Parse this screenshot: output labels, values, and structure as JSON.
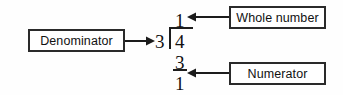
{
  "diagram": {
    "type": "long-division-callout",
    "colors": {
      "background": "#fefefe",
      "stroke": "#2a2a2a",
      "text": "#111111",
      "rule": "#1c1c1c"
    },
    "callouts": [
      {
        "id": "denominator",
        "label": "Denominator",
        "points_to": "divisor",
        "arrow_direction": "right"
      },
      {
        "id": "whole_number",
        "label": "Whole number",
        "points_to": "quotient",
        "arrow_direction": "left"
      },
      {
        "id": "numerator",
        "label": "Numerator",
        "points_to": "remainder",
        "arrow_direction": "left"
      }
    ],
    "division": {
      "divisor": "3",
      "dividend": "4",
      "quotient": "1",
      "subtrahend": "3",
      "remainder": "1"
    }
  }
}
